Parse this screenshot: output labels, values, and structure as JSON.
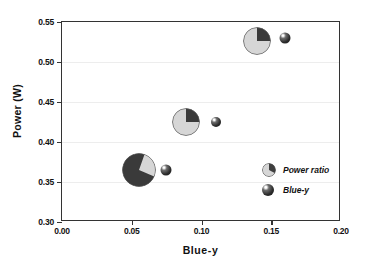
{
  "chart_data": {
    "type": "scatter",
    "title": "",
    "xlabel": "Blue-y",
    "ylabel": "Power (W)",
    "xlim": [
      0.0,
      0.2
    ],
    "ylim": [
      0.3,
      0.55
    ],
    "xticks": [
      "0.00",
      "0.05",
      "0.10",
      "0.15",
      "0.20"
    ],
    "xtick_values": [
      0.0,
      0.05,
      0.1,
      0.15,
      0.2
    ],
    "yticks": [
      "0.30",
      "0.35",
      "0.40",
      "0.45",
      "0.50",
      "0.55"
    ],
    "ytick_values": [
      0.3,
      0.35,
      0.4,
      0.45,
      0.5,
      0.55
    ],
    "grid": "horizontal",
    "legend_position": "lower-right",
    "series": [
      {
        "name": "Power ratio",
        "marker": "pie",
        "points": [
          {
            "x": 0.055,
            "y": 0.3645,
            "size_px": 34,
            "dark_fraction": 0.74,
            "start_angle_deg": 113
          },
          {
            "x": 0.089,
            "y": 0.4255,
            "size_px": 28,
            "dark_fraction": 0.25,
            "start_angle_deg": 0
          },
          {
            "x": 0.14,
            "y": 0.5265,
            "size_px": 28,
            "dark_fraction": 0.25,
            "start_angle_deg": 0
          }
        ]
      },
      {
        "name": "Blue-y",
        "marker": "sphere",
        "points": [
          {
            "x": 0.0745,
            "y": 0.3645,
            "size_px": 11
          },
          {
            "x": 0.1105,
            "y": 0.425,
            "size_px": 10
          },
          {
            "x": 0.16,
            "y": 0.5295,
            "size_px": 11
          }
        ]
      }
    ],
    "colors": {
      "dark_wedge": "#3a3a3a",
      "light_wedge": "#d6d6d6",
      "sphere": "#222222",
      "axis": "#333333",
      "grid": "#ededed",
      "text": "#111111"
    }
  },
  "legend": {
    "items": [
      {
        "label": "Power ratio",
        "marker": "pie-marker-icon"
      },
      {
        "label": "Blue-y",
        "marker": "sphere-marker-icon"
      }
    ]
  }
}
